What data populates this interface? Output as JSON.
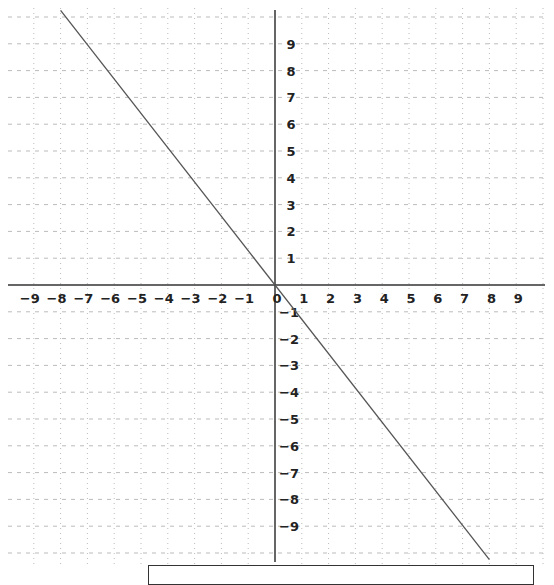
{
  "chart_data": {
    "type": "line",
    "title": "",
    "xlabel": "",
    "ylabel": "",
    "xlim": [
      -10,
      10
    ],
    "ylim": [
      -10,
      10
    ],
    "grid": true,
    "x_ticks": [
      -9,
      -8,
      -7,
      -6,
      -5,
      -4,
      -3,
      -2,
      -1,
      0,
      1,
      2,
      3,
      4,
      5,
      6,
      7,
      8,
      9
    ],
    "y_ticks": [
      9,
      8,
      7,
      6,
      5,
      4,
      3,
      2,
      1,
      -1,
      -2,
      -3,
      -4,
      -5,
      -6,
      -7,
      -8,
      -9
    ],
    "series": [
      {
        "name": "line",
        "equation": "y = -1.25x",
        "x": [
          -8,
          8
        ],
        "y": [
          10.25,
          -10.25
        ]
      }
    ],
    "legend": null
  },
  "colors": {
    "axis": "#333333",
    "grid": "#bbbbbb",
    "line": "#555555",
    "label": "#222222"
  },
  "bottom_box": {
    "text": ""
  }
}
